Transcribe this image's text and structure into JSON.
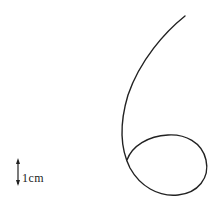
{
  "diagram": {
    "type": "trajectory-curve",
    "stroke_color": "#222222",
    "background": "#ffffff",
    "scale_bar": {
      "label": "1cm",
      "orientation": "vertical",
      "arrows": "both-ends"
    },
    "curve": {
      "description": "Single continuous curve starting top-right, sweeping down-left, then forming a closed loop at the bottom right (shape resembling the digit 6)",
      "path": "M185,16 C165,32 140,60 128,95 C119,125 121,150 130,168 C140,186 158,197 178,195 C198,193 210,178 206,160 C202,142 185,134 168,135 C148,136 132,146 127,160"
    }
  }
}
